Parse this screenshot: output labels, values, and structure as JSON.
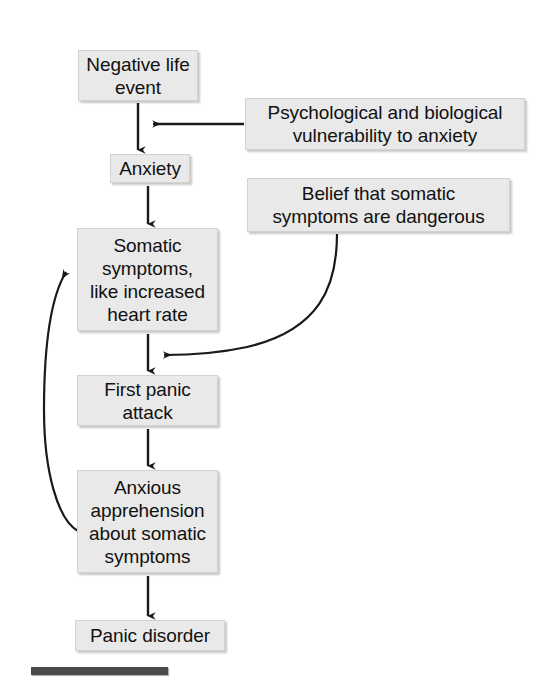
{
  "figure": {
    "type": "flowchart",
    "title": "",
    "background_color": "#ffffff",
    "node_fill_color": "#e9e9e9",
    "node_border_color": "#d2d2d2",
    "connector_color": "#1a1a1a",
    "bottom_bar_color": "#4a4a4a"
  },
  "nodes": {
    "negative_life_event": "Negative life\nevent",
    "vulnerability": "Psychological and biological\nvulnerability to anxiety",
    "anxiety": "Anxiety",
    "belief": "Belief that somatic\nsymptoms are dangerous",
    "somatic_symptoms": "Somatic\nsymptoms,\nlike increased\nheart rate",
    "first_panic_attack": "First panic\nattack",
    "anxious_apprehension": "Anxious\napprehension\nabout somatic\nsymptoms",
    "panic_disorder": "Panic disorder"
  },
  "connectors": [
    {
      "name": "negative-life-event-to-anxiety",
      "from": "negative_life_event",
      "to": "anxiety",
      "style": "straight-vertical-arrow"
    },
    {
      "name": "vulnerability-to-chain",
      "from": "vulnerability",
      "to": "negative-life-event-to-anxiety-line",
      "style": "elbow-horizontal-arrow"
    },
    {
      "name": "anxiety-to-somatic-symptoms",
      "from": "anxiety",
      "to": "somatic_symptoms",
      "style": "straight-vertical-arrow"
    },
    {
      "name": "somatic-symptoms-to-first-panic-attack",
      "from": "somatic_symptoms",
      "to": "first_panic_attack",
      "style": "straight-vertical-arrow"
    },
    {
      "name": "belief-to-first-panic-attack-line",
      "from": "belief",
      "to": "somatic-symptoms-to-first-panic-attack-line",
      "style": "curved-arrow"
    },
    {
      "name": "first-panic-attack-to-anxious-apprehension",
      "from": "first_panic_attack",
      "to": "anxious_apprehension",
      "style": "straight-vertical-arrow"
    },
    {
      "name": "anxious-apprehension-to-somatic-symptoms-feedback",
      "from": "anxious_apprehension",
      "to": "somatic_symptoms",
      "style": "curved-feedback-loop-arrow"
    },
    {
      "name": "anxious-apprehension-to-panic-disorder",
      "from": "anxious_apprehension",
      "to": "panic_disorder",
      "style": "straight-vertical-arrow"
    }
  ]
}
